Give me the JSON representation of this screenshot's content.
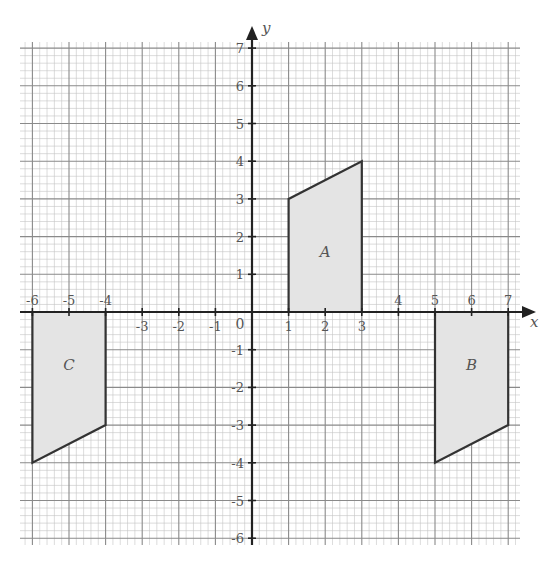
{
  "diagram": {
    "type": "coordinate-grid",
    "x_axis": {
      "label": "x",
      "min": -6,
      "max": 7
    },
    "y_axis": {
      "label": "y",
      "min": -6,
      "max": 7
    },
    "origin_label": "0",
    "x_ticks": [
      {
        "value": -6,
        "label": "-6",
        "position": "above"
      },
      {
        "value": -5,
        "label": "-5",
        "position": "above"
      },
      {
        "value": -4,
        "label": "-4",
        "position": "above"
      },
      {
        "value": -3,
        "label": "-3",
        "position": "below"
      },
      {
        "value": -2,
        "label": "-2",
        "position": "below"
      },
      {
        "value": -1,
        "label": "-1",
        "position": "below"
      },
      {
        "value": 1,
        "label": "1",
        "position": "below"
      },
      {
        "value": 2,
        "label": "2",
        "position": "below"
      },
      {
        "value": 3,
        "label": "3",
        "position": "below"
      },
      {
        "value": 4,
        "label": "4",
        "position": "above"
      },
      {
        "value": 5,
        "label": "5",
        "position": "above"
      },
      {
        "value": 6,
        "label": "6",
        "position": "above"
      },
      {
        "value": 7,
        "label": "7",
        "position": "above"
      }
    ],
    "y_ticks": [
      {
        "value": 7,
        "label": "7"
      },
      {
        "value": 6,
        "label": "6"
      },
      {
        "value": 5,
        "label": "5"
      },
      {
        "value": 4,
        "label": "4"
      },
      {
        "value": 3,
        "label": "3"
      },
      {
        "value": 2,
        "label": "2"
      },
      {
        "value": 1,
        "label": "1"
      },
      {
        "value": -1,
        "label": "-1"
      },
      {
        "value": -2,
        "label": "-2"
      },
      {
        "value": -3,
        "label": "-3"
      },
      {
        "value": -4,
        "label": "-4"
      },
      {
        "value": -5,
        "label": "-5"
      },
      {
        "value": -6,
        "label": "-6"
      }
    ],
    "shapes": [
      {
        "name": "A",
        "label": "A",
        "vertices": [
          [
            1,
            0
          ],
          [
            1,
            3
          ],
          [
            3,
            4
          ],
          [
            3,
            0
          ]
        ],
        "label_at": [
          2,
          1.6
        ]
      },
      {
        "name": "B",
        "label": "B",
        "vertices": [
          [
            5,
            0
          ],
          [
            5,
            -4
          ],
          [
            7,
            -3
          ],
          [
            7,
            0
          ]
        ],
        "label_at": [
          6,
          -1.4
        ]
      },
      {
        "name": "C",
        "label": "C",
        "vertices": [
          [
            -6,
            0
          ],
          [
            -6,
            -4
          ],
          [
            -4,
            -3
          ],
          [
            -4,
            0
          ]
        ],
        "label_at": [
          -5,
          -1.4
        ]
      }
    ],
    "colors": {
      "shape_fill": "#e4e4e4",
      "shape_stroke": "#333333",
      "axis": "#222222",
      "grid_major": "#8a8a8a",
      "grid_minor": "#c4c4c4",
      "label": "#555555"
    }
  }
}
